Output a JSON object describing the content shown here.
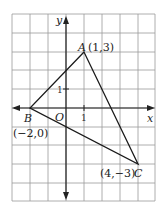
{
  "diagram": {
    "type": "coordinate-plane-triangle",
    "axes": {
      "x_label": "x",
      "y_label": "y",
      "origin_label": "O",
      "unit_x_label": "1",
      "unit_y_label": "1"
    },
    "grid": {
      "x_min": -3,
      "x_max": 5,
      "y_min": -5,
      "y_max": 5
    },
    "points": [
      {
        "name": "A",
        "coords_label": "(1,3)",
        "x": 1,
        "y": 3
      },
      {
        "name": "B",
        "coords_label": "(−2,0)",
        "x": -2,
        "y": 0
      },
      {
        "name": "C",
        "coords_label": "(4,−3)",
        "x": 4,
        "y": -3
      }
    ]
  }
}
